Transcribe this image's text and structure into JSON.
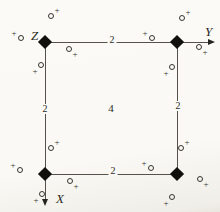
{
  "figure": {
    "background_color": "#faf9f5",
    "line_color": "#55524c",
    "symbol_color": "#12100d",
    "ink_color": "#2e2c26",
    "axis_labels": {
      "x": "X",
      "y": "Y",
      "z": "Z"
    },
    "center_label": "4",
    "plus_glyph": "+",
    "cell": {
      "x1": 45,
      "y1": 42,
      "x2": 177,
      "y2": 174
    },
    "twofold_labels": [
      {
        "x": 112,
        "y": 40,
        "text": "2"
      },
      {
        "x": 45,
        "y": 109,
        "text": "2"
      },
      {
        "x": 178,
        "y": 106,
        "text": "2"
      },
      {
        "x": 113,
        "y": 171,
        "text": "2"
      }
    ],
    "fourfold_points": [
      {
        "x": 45,
        "y": 42
      },
      {
        "x": 177,
        "y": 42
      },
      {
        "x": 45,
        "y": 174
      },
      {
        "x": 177,
        "y": 174
      }
    ],
    "general_positions": [
      {
        "x": 51,
        "y": 16,
        "plus": "ne"
      },
      {
        "x": 21,
        "y": 38,
        "plus": "nw"
      },
      {
        "x": 69,
        "y": 49,
        "plus": "se"
      },
      {
        "x": 41,
        "y": 65,
        "plus": "sw"
      },
      {
        "x": 182,
        "y": 18,
        "plus": "ne"
      },
      {
        "x": 152,
        "y": 38,
        "plus": "nw"
      },
      {
        "x": 199,
        "y": 47,
        "plus": "se"
      },
      {
        "x": 172,
        "y": 67,
        "plus": "sw"
      },
      {
        "x": 51,
        "y": 148,
        "plus": "ne"
      },
      {
        "x": 20,
        "y": 170,
        "plus": "nw"
      },
      {
        "x": 70,
        "y": 181,
        "plus": "se"
      },
      {
        "x": 42,
        "y": 194,
        "plus": "sw"
      },
      {
        "x": 181,
        "y": 148,
        "plus": "ne"
      },
      {
        "x": 151,
        "y": 168,
        "plus": "nw"
      },
      {
        "x": 200,
        "y": 179,
        "plus": "se"
      },
      {
        "x": 172,
        "y": 197,
        "plus": "sw"
      }
    ]
  }
}
